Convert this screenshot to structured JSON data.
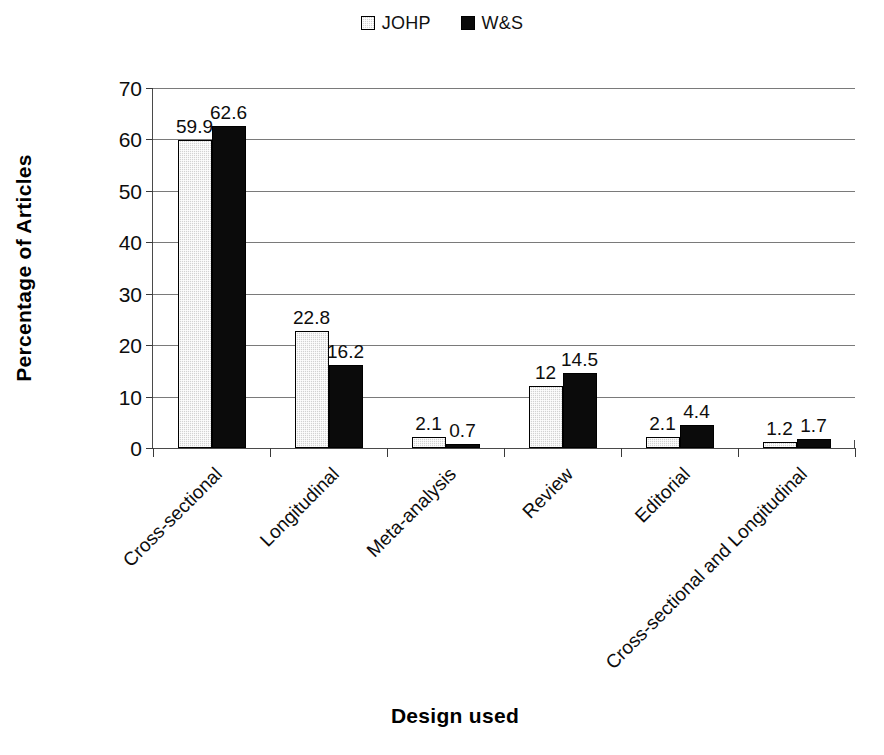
{
  "chart_data": {
    "type": "bar",
    "title": "",
    "xlabel": "Design used",
    "ylabel": "Percentage of Articles",
    "categories": [
      "Cross-sectional",
      "Longitudinal",
      "Meta-analysis",
      "Review",
      "Editorial",
      "Cross-sectional and Longitudinal"
    ],
    "series": [
      {
        "name": "JOHP",
        "color": "#d2d2d2",
        "values": [
          59.9,
          22.8,
          2.1,
          12,
          2.1,
          1.2
        ],
        "labels": [
          "59.9",
          "22.8",
          "2.1",
          "12",
          "2.1",
          "1.2"
        ]
      },
      {
        "name": "W&S",
        "color": "#0b0b0b",
        "values": [
          62.6,
          16.2,
          0.7,
          14.5,
          4.4,
          1.7
        ],
        "labels": [
          "62.6",
          "16.2",
          "0.7",
          "14.5",
          "4.4",
          "1.7"
        ]
      }
    ],
    "ylim": [
      0,
      70
    ],
    "yticks": [
      0,
      10,
      20,
      30,
      40,
      50,
      60,
      70
    ],
    "ytick_labels": [
      "0",
      "10",
      "20",
      "30",
      "40",
      "50",
      "60",
      "70"
    ],
    "grid": true,
    "grid_axis": "y",
    "legend_position": "top-center",
    "bar_value_labels": true,
    "xtick_label_rotation": -45
  },
  "legend": {
    "entries": [
      {
        "label": "JOHP",
        "swatch": "series-johp",
        "icon": "legend-swatch-icon"
      },
      {
        "label": "W&S",
        "swatch": "series-ws",
        "icon": "legend-swatch-icon"
      }
    ]
  },
  "axes": {
    "y_title": "Percentage of Articles",
    "x_title": "Design used"
  }
}
